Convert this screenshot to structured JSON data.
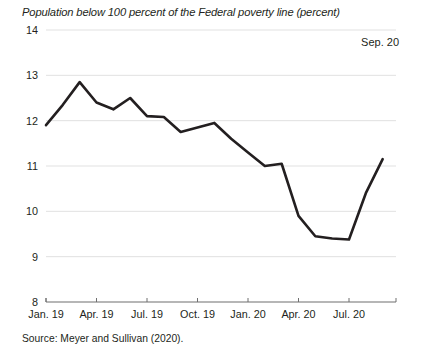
{
  "chart_data": {
    "type": "line",
    "title": "Population below 100 percent of the Federal poverty line (percent)",
    "xlabel": "",
    "ylabel": "",
    "ylim": [
      8,
      14
    ],
    "ytick_values": [
      8,
      9,
      10,
      11,
      12,
      13,
      14
    ],
    "ytick_labels": [
      "8",
      "9",
      "10",
      "11",
      "12",
      "13",
      "14"
    ],
    "grid": true,
    "legend": "none",
    "annotation": "Sep. 20",
    "source": "Source: Meyer and Sullivan (2020).",
    "xtick_labels": [
      "Jan. 19",
      "Apr. 19",
      "Jul. 19",
      "Oct. 19",
      "Jan. 20",
      "Apr. 20",
      "Jul. 20"
    ],
    "xtick_indices": [
      0,
      3,
      6,
      9,
      12,
      15,
      18
    ],
    "x": [
      "Jan. 19",
      "Feb. 19",
      "Mar. 19",
      "Apr. 19",
      "May 19",
      "Jun. 19",
      "Jul. 19",
      "Aug. 19",
      "Sep. 19",
      "Oct. 19",
      "Nov. 19",
      "Dec. 19",
      "Jan. 20",
      "Feb. 20",
      "Mar. 20",
      "Apr. 20",
      "May 20",
      "Jun. 20",
      "Jul. 20",
      "Aug. 20",
      "Sep. 20"
    ],
    "values": [
      11.9,
      12.35,
      12.85,
      12.4,
      12.25,
      12.5,
      12.1,
      12.08,
      11.75,
      11.85,
      11.95,
      11.6,
      11.3,
      11.0,
      11.05,
      9.9,
      9.45,
      9.4,
      9.38,
      10.4,
      11.15
    ],
    "series": [
      {
        "name": "Population below 100 percent of the Federal poverty line",
        "color": "#231f20",
        "values": [
          11.9,
          12.35,
          12.85,
          12.4,
          12.25,
          12.5,
          12.1,
          12.08,
          11.75,
          11.85,
          11.95,
          11.6,
          11.3,
          11.0,
          11.05,
          9.9,
          9.45,
          9.4,
          9.38,
          10.4,
          11.15
        ]
      }
    ]
  },
  "colors": {
    "line": "#231f20",
    "grid": "#d9d9d9",
    "axis": "#6f6f6f",
    "text": "#231f20",
    "background": "#ffffff"
  }
}
